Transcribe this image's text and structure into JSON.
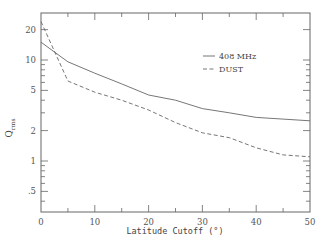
{
  "chart_data": {
    "type": "line",
    "title": "",
    "xlabel": "Latitude Cutoff (°)",
    "ylabel": "Q_rms",
    "ylabel_main": "Q",
    "ylabel_sub": "rms",
    "xlim": [
      0,
      50
    ],
    "ylim": [
      0.31,
      29
    ],
    "yscale": "log",
    "grid": false,
    "legend_position": "upper right (inside)",
    "x_ticks": [
      0,
      10,
      20,
      30,
      40,
      50
    ],
    "x_tick_labels": [
      "0",
      "10",
      "20",
      "30",
      "40",
      "50"
    ],
    "y_ticks": [
      0.5,
      1,
      2,
      5,
      10,
      20
    ],
    "y_tick_labels": [
      ".5",
      "1",
      "2",
      "5",
      "10",
      "20"
    ],
    "x": [
      0,
      5,
      10,
      15,
      20,
      25,
      30,
      35,
      40,
      45,
      50
    ],
    "series": [
      {
        "name": "408 MHz",
        "style": "solid",
        "values": [
          15.0,
          9.6,
          7.4,
          5.8,
          4.5,
          4.0,
          3.3,
          3.0,
          2.7,
          2.6,
          2.5
        ]
      },
      {
        "name": "DUST",
        "style": "dashed",
        "values": [
          24.0,
          6.2,
          4.8,
          4.0,
          3.2,
          2.4,
          1.9,
          1.7,
          1.35,
          1.15,
          1.1
        ]
      }
    ]
  },
  "legend": {
    "items": [
      {
        "label": "408 MHz",
        "style": "solid"
      },
      {
        "label": "DUST",
        "style": "dashed"
      }
    ]
  },
  "axes": {
    "xlabel": "Latitude Cutoff (°)",
    "ylabel_main": "Q",
    "ylabel_sub": "rms"
  },
  "colors": {
    "line": "#666666",
    "text": "#444444",
    "background": "#ffffff"
  }
}
